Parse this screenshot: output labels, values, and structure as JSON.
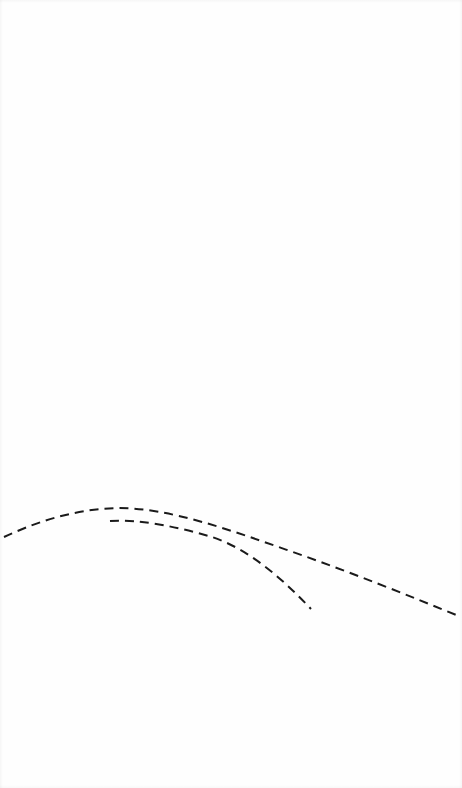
{
  "figure": {
    "background_color": "#fefefe",
    "ink_color": "#1a1a1a",
    "width": 462,
    "height": 788,
    "title": "",
    "caption": ""
  },
  "chart_data": {
    "type": "line",
    "title": "",
    "subtitle": "",
    "xlabel": "",
    "ylabel": "",
    "xlim": [
      0,
      462
    ],
    "ylim": [
      788,
      0
    ],
    "grid": false,
    "axes_visible": false,
    "tick_labels_x": [],
    "tick_labels_y": [],
    "legend": [],
    "legend_position": "none",
    "annotations": [],
    "series": [
      {
        "name": "upper-dashed-curve",
        "style": "dashed",
        "color": "#1a1a1a",
        "line_width": 2,
        "dash_pattern": [
          9,
          6
        ],
        "peak": {
          "x": 118,
          "y": 508
        },
        "x": [
          4,
          20,
          40,
          60,
          80,
          100,
          118,
          140,
          160,
          180,
          200,
          220,
          240,
          260,
          280,
          300,
          320,
          340,
          360,
          380,
          400,
          420,
          440,
          461
        ],
        "y": [
          537,
          529,
          521,
          515,
          511,
          509,
          508,
          510,
          513,
          516,
          521,
          527,
          533,
          540,
          547,
          554,
          561,
          568,
          575,
          582,
          589,
          597,
          606,
          617
        ]
      },
      {
        "name": "lower-dashed-curve",
        "style": "dashed",
        "color": "#1a1a1a",
        "line_width": 2,
        "dash_pattern": [
          9,
          6
        ],
        "peak": {
          "x": 122,
          "y": 520
        },
        "x": [
          110,
          122,
          140,
          160,
          180,
          200,
          215,
          230,
          245,
          260,
          275,
          290,
          300,
          311
        ],
        "y": [
          521,
          520,
          521,
          524,
          528,
          533,
          538,
          546,
          557,
          569,
          581,
          594,
          601,
          609
        ]
      }
    ]
  },
  "paths": {
    "upper_curve_d": "M 4 537 C 30 525, 70 509, 118 508 C 170 508, 230 530, 290 551 C 350 572, 410 596, 461 617",
    "lower_curve_d": "M 110 521 C 140 519, 178 527, 212 537 C 246 548, 280 576, 311 609"
  },
  "elements": {
    "upper_curve_name": "upper-dashed-curve",
    "lower_curve_name": "lower-dashed-curve",
    "canvas_name": "figure-canvas"
  }
}
